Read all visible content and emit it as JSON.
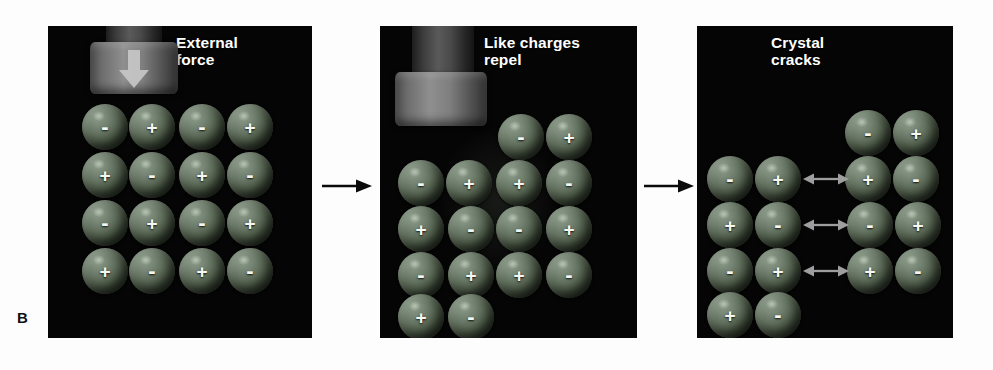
{
  "figure": {
    "letter": "B",
    "caption_absent": true
  },
  "colors": {
    "panel_background": "#050505",
    "title_text": "#ffffff",
    "ion_sphere": "#5d6b58",
    "ion_sign": "#f4f7f2",
    "piston_metal": "#8f8f8f",
    "piston_arrow": "#c8c8c8",
    "repulsion_arrow": "#9a9a9a",
    "step_arrow": "#000000",
    "page_background": "#fdfdfd"
  },
  "panels": [
    {
      "id": "external-force",
      "title": "External\nforce",
      "title_line_1": "External",
      "title_line_2": "force",
      "piston": {
        "present": true,
        "state": "raised",
        "arrow_direction": "down",
        "arrow_visible": true
      },
      "lattice": {
        "rows": 4,
        "columns": 4,
        "offset": "aligned",
        "signs": [
          [
            "-",
            "+",
            "-",
            "+"
          ],
          [
            "+",
            "-",
            "+",
            "-"
          ],
          [
            "-",
            "+",
            "-",
            "+"
          ],
          [
            "+",
            "-",
            "+",
            "-"
          ]
        ]
      },
      "repulsion_arrows": 0
    },
    {
      "id": "like-charges-repel",
      "title": "Like charges\nrepel",
      "title_line_1": "Like charges",
      "title_line_2": "repel",
      "piston": {
        "present": true,
        "state": "pressed-down",
        "arrow_direction": "down",
        "arrow_visible": false
      },
      "lattice": {
        "rows": 5,
        "columns": 4,
        "offset": "sheared",
        "description": "upper block shifted one ion-width so like charges become neighbours",
        "signs": [
          [
            "",
            "",
            "-",
            "+"
          ],
          [
            "-",
            "+",
            "+",
            "-"
          ],
          [
            "+",
            "-",
            "-",
            "+"
          ],
          [
            "-",
            "+",
            "+",
            "-"
          ],
          [
            "+",
            "-",
            "",
            ""
          ]
        ]
      },
      "repulsion_arrows": 0
    },
    {
      "id": "crystal-cracks",
      "title": "Crystal\ncracks",
      "title_line_1": "Crystal",
      "title_line_2": "cracks",
      "piston": {
        "present": false,
        "state": "removed",
        "arrow_direction": "",
        "arrow_visible": false
      },
      "lattice": {
        "rows": 5,
        "columns": 4,
        "offset": "split",
        "description": "crystal separated into left and right halves with a vertical crack",
        "left_signs": [
          [
            "",
            ""
          ],
          [
            "-",
            "+"
          ],
          [
            "+",
            "-"
          ],
          [
            "-",
            "+"
          ],
          [
            "+",
            "-"
          ]
        ],
        "right_signs": [
          [
            "-",
            "+"
          ],
          [
            "+",
            "-"
          ],
          [
            "-",
            "+"
          ],
          [
            "+",
            "-"
          ],
          [
            "",
            ""
          ]
        ]
      },
      "repulsion_arrows": 3
    }
  ],
  "step_arrows": [
    {
      "id": "arrow-panel1-to-panel2",
      "direction": "right"
    },
    {
      "id": "arrow-panel2-to-panel3",
      "direction": "right"
    }
  ]
}
